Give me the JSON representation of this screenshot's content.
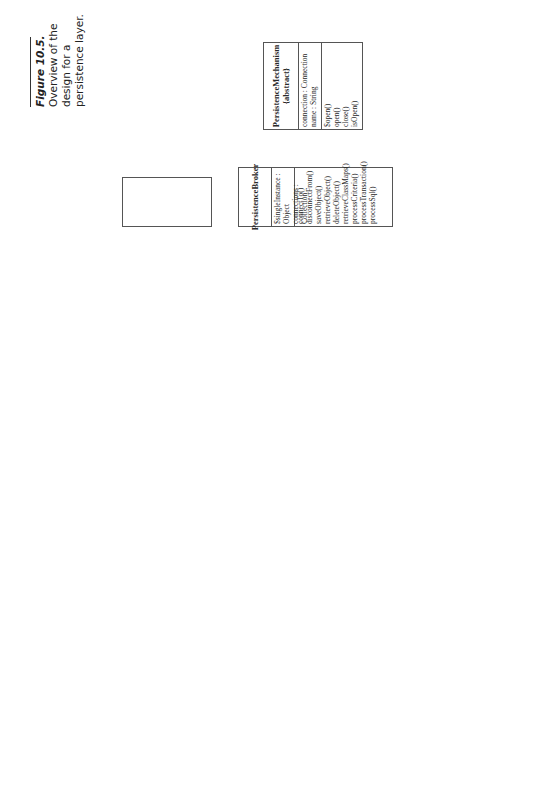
{
  "caption": {
    "figure": "Figure 10.5.",
    "lines": [
      "Overview of the",
      "design for a",
      "persistence layer."
    ]
  },
  "classes": {
    "persistence_mechanism": {
      "name": "PersistenceMechanism {abstract}",
      "attributes": [
        "connection : Connection",
        "name : String"
      ],
      "methods": [
        "$open()",
        "open()",
        "close()",
        "isOpen()"
      ]
    },
    "persistence_broker": {
      "name": "PersistenceBroker",
      "attributes": [
        "$singleInstance : Object",
        "connections : Collection"
      ],
      "methods": [
        "connectTo()",
        "disconnectFrom()",
        "saveObject()",
        "retrieveObject()",
        "deleteObject()",
        "retrieveClassMaps()",
        "processCriteria()",
        "processTransaction()",
        "processSql()"
      ]
    },
    "class_map": {
      "name": "ClassMap",
      "attributes": [
        "className : String"
      ],
      "methods": [
        "getInsertSqlFor()",
        "getDeleteSqlFor()",
        "getUpdateSqlFor()",
        "getSelectSqlFor()"
      ]
    },
    "sql_statement": {
      "name": "SqlStatement {abstract}",
      "attributes": [
        "statementComponents : Collection"
      ],
      "methods": [
        "buildForObject()",
        "buildForCriteria()",
        "asString()"
      ]
    },
    "persistent_object": {
      "name": "PersistentObject {abstract}",
      "attributes": [
        "isProxy : Boolean",
        "isPersistent : Boolean",
        "timeStamp : DateTime"
      ],
      "methods": [
        "save()",
        "retrieve()",
        "delete()"
      ]
    },
    "persistent_criteria": {
      "name": "PersistentCriteria",
      "attributes": [
        "isSubclassesIncluded : Boolean"
      ],
      "methods": [
        "addSelectClause()",
        "addOrCriteria()",
        "perform()"
      ]
    },
    "persistent_transaction": {
      "name": "PersistentTransaction {abstract}",
      "attributes": [
        "tasks : Collection"
      ],
      "methods": [
        "attempt()",
        "rollback()",
        "commit()",
        "addTransaction()",
        "addSaveObject()",
        "addRetrieveObject()",
        "addDeleteObject()",
        "addCriteria()"
      ]
    },
    "cursor": {
      "name": "Cursor",
      "attributes": [
        "size : Integer"
      ],
      "methods": [
        "nextObjects()",
        "nextProxies()",
        "nextRows()",
        "previousObjects()",
        "previousProxies()",
        "previousRows()"
      ]
    }
  },
  "associations": {
    "broker_mechanism": {
      "label": "connects to 0..n",
      "mult_broker": "1..1"
    },
    "broker_classmap": {
      "label": "uses",
      "mult_classmap": "0..n"
    },
    "sql_classmap": {
      "label": "created from",
      "mult_classmap": "1..1"
    },
    "object_classmap": {
      "label": "maps $",
      "mult_classmap": "1..1"
    },
    "object_sql": {
      "mult_sql": "1..n",
      "mult_object": "0..1"
    },
    "object_broker": {
      "label": "processed by",
      "mult_broker": "1..1"
    },
    "criteria_broker": {
      "label": "processed by",
      "mult_broker": "1..1"
    },
    "transaction_broker": {
      "label": "processed by",
      "mult_broker": "1..1"
    },
    "criteria_cursor": {
      "label": "creates",
      "mult_criteria": "1..1",
      "mult_cursor": "0..n"
    },
    "criteria_transaction": {
      "mult_criteria": "0..n"
    },
    "object_transaction": {
      "mult_object": "0..n"
    },
    "transaction_self": {
      "mult": "0..n"
    }
  }
}
